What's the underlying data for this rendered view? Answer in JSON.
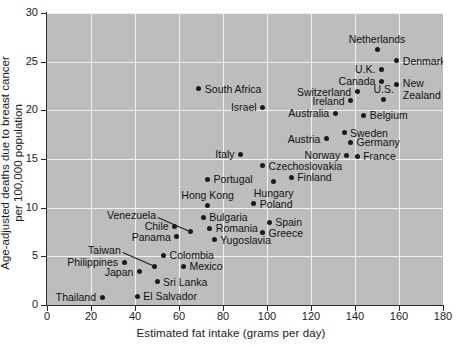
{
  "chart_data": {
    "type": "scatter",
    "title": "",
    "xlabel": "Estimated fat intake (grams per day)",
    "ylabel": "Age-adjusted deaths due to breast cancer per 100,000 population",
    "ylabel_line1": "Age-adjusted deaths due to breast cancer",
    "ylabel_line2": "per 100,000 population",
    "xlim": [
      0,
      180
    ],
    "ylim": [
      0,
      30
    ],
    "xticks": [
      0,
      20,
      40,
      60,
      80,
      100,
      120,
      140,
      160,
      180
    ],
    "yticks": [
      0,
      5,
      10,
      15,
      20,
      25,
      30
    ],
    "grid": true,
    "legend": "none",
    "panel_color": "#bdbdbd",
    "grid_color": "#f2f2f2",
    "marker_color": "#1b1b1b",
    "points": [
      {
        "label": "Thailand",
        "x": 25,
        "y": 0.8,
        "pos": "left"
      },
      {
        "label": "El Salvador",
        "x": 41,
        "y": 0.9,
        "pos": "right"
      },
      {
        "label": "Sri Lanka",
        "x": 50,
        "y": 2.4,
        "pos": "right"
      },
      {
        "label": "Japan",
        "x": 42,
        "y": 3.4,
        "pos": "left"
      },
      {
        "label": "Taiwan",
        "x": 49,
        "y": 4.0,
        "pos": "leader-left"
      },
      {
        "label": "Philippines",
        "x": 35,
        "y": 4.4,
        "pos": "left"
      },
      {
        "label": "Mexico",
        "x": 62,
        "y": 4.0,
        "pos": "right"
      },
      {
        "label": "Colombia",
        "x": 53,
        "y": 5.1,
        "pos": "right"
      },
      {
        "label": "Yugoslavia",
        "x": 76,
        "y": 6.7,
        "pos": "right"
      },
      {
        "label": "Panama",
        "x": 59,
        "y": 7.0,
        "pos": "left"
      },
      {
        "label": "Greece",
        "x": 98,
        "y": 7.4,
        "pos": "right"
      },
      {
        "label": "Romania",
        "x": 74,
        "y": 7.9,
        "pos": "right"
      },
      {
        "label": "Chile",
        "x": 58,
        "y": 8.1,
        "pos": "left"
      },
      {
        "label": "Venezuela",
        "x": 65,
        "y": 7.6,
        "pos": "leader-left"
      },
      {
        "label": "Spain",
        "x": 101,
        "y": 8.5,
        "pos": "right"
      },
      {
        "label": "Bulgaria",
        "x": 71,
        "y": 9.0,
        "pos": "right"
      },
      {
        "label": "Hong Kong",
        "x": 73,
        "y": 10.2,
        "pos": "above"
      },
      {
        "label": "Poland",
        "x": 94,
        "y": 10.4,
        "pos": "right"
      },
      {
        "label": "Hungary",
        "x": 103,
        "y": 12.7,
        "pos": "below"
      },
      {
        "label": "Portugal",
        "x": 73,
        "y": 12.9,
        "pos": "right"
      },
      {
        "label": "Finland",
        "x": 111,
        "y": 13.1,
        "pos": "right"
      },
      {
        "label": "Czechoslovakia",
        "x": 98,
        "y": 14.3,
        "pos": "right"
      },
      {
        "label": "Italy",
        "x": 88,
        "y": 15.5,
        "pos": "left"
      },
      {
        "label": "France",
        "x": 141,
        "y": 15.3,
        "pos": "right"
      },
      {
        "label": "Norway",
        "x": 136,
        "y": 15.4,
        "pos": "left"
      },
      {
        "label": "Germany",
        "x": 138,
        "y": 16.7,
        "pos": "right"
      },
      {
        "label": "Austria",
        "x": 127,
        "y": 17.1,
        "pos": "left"
      },
      {
        "label": "Sweden",
        "x": 135,
        "y": 17.7,
        "pos": "right"
      },
      {
        "label": "Australia",
        "x": 131,
        "y": 19.7,
        "pos": "left"
      },
      {
        "label": "Belgium",
        "x": 144,
        "y": 19.5,
        "pos": "right"
      },
      {
        "label": "Israel",
        "x": 98,
        "y": 20.3,
        "pos": "left"
      },
      {
        "label": "Ireland",
        "x": 138,
        "y": 21.0,
        "pos": "left"
      },
      {
        "label": "U.S.",
        "x": 153,
        "y": 21.1,
        "pos": "above"
      },
      {
        "label": "Switzerland",
        "x": 141,
        "y": 21.9,
        "pos": "left"
      },
      {
        "label": "South Africa",
        "x": 69,
        "y": 22.2,
        "pos": "right"
      },
      {
        "label": "New Zealand",
        "x": 159,
        "y": 22.7,
        "pos": "right-two"
      },
      {
        "label": "Canada",
        "x": 152,
        "y": 23.0,
        "pos": "left"
      },
      {
        "label": "U.K.",
        "x": 152,
        "y": 24.2,
        "pos": "left"
      },
      {
        "label": "Denmark",
        "x": 159,
        "y": 25.1,
        "pos": "right"
      },
      {
        "label": "Netherlands",
        "x": 150,
        "y": 26.2,
        "pos": "above"
      }
    ]
  }
}
